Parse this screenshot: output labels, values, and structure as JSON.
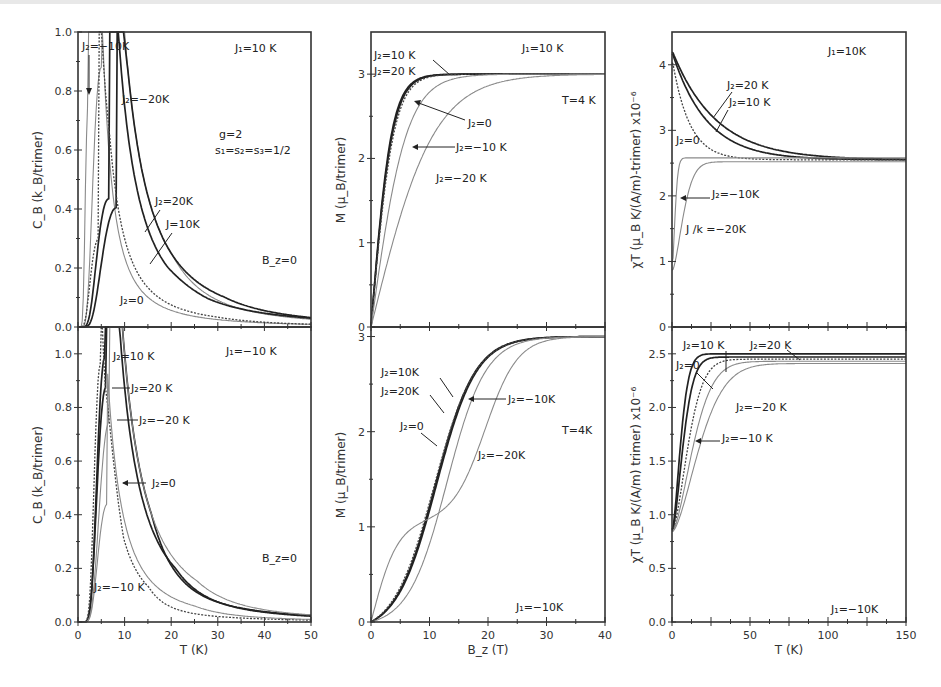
{
  "figure": {
    "params": {
      "g": "g=2",
      "spins": "s1=s2=s3=1/2"
    }
  },
  "chart_data": [
    {
      "id": "cb-top",
      "type": "line",
      "title": "",
      "xlabel": "T (K)",
      "ylabel": "C_B (k_B/trimer)",
      "xlim": [
        0,
        50
      ],
      "ylim": [
        0,
        1.0
      ],
      "xticks": [
        0,
        10,
        20,
        30,
        40,
        50
      ],
      "yticks": [
        0.0,
        0.2,
        0.4,
        0.6,
        0.8,
        1.0
      ],
      "ytick_labels": [
        "0.0",
        "0.2",
        "0.4",
        "0.6",
        "0.8",
        "1.0"
      ],
      "show_xtick_labels": false,
      "grid": false,
      "annotations": [
        "J1=10K",
        "g=2",
        "s1=s2=s3=1/2",
        "B_z=0"
      ],
      "series": [
        {
          "name": "J2=-10K",
          "style": "gray",
          "peak_T": 2.2,
          "peak_C": 0.76,
          "width": 0.55,
          "tail": 0.015
        },
        {
          "name": "J2=-20K",
          "style": "gray",
          "peak_T": 5.0,
          "peak_C": 0.88,
          "width": 0.7,
          "tail": 0.04
        },
        {
          "name": "J2=20K",
          "style": "black",
          "peak_T": 6.6,
          "peak_C": 0.435,
          "width": 0.75,
          "tail": 0.04
        },
        {
          "name": "J2=10K",
          "style": "black",
          "peak_T": 8.3,
          "peak_C": 0.405,
          "width": 0.75,
          "tail": 0.03
        },
        {
          "name": "J2=0",
          "style": "dotted",
          "peak_T": 4.5,
          "peak_C": 0.3,
          "width": 0.8,
          "tail": 0.012
        }
      ]
    },
    {
      "id": "cb-bottom",
      "type": "line",
      "xlabel": "T (K)",
      "ylabel": "C_B (k_B/trimer)",
      "xlim": [
        0,
        50
      ],
      "ylim": [
        0,
        1.1
      ],
      "xticks": [
        0,
        10,
        20,
        30,
        40,
        50
      ],
      "yticks": [
        0.0,
        0.2,
        0.4,
        0.6,
        0.8,
        1.0
      ],
      "ytick_labels": [
        "0.0",
        "0.2",
        "0.4",
        "0.6",
        "0.8",
        "1.0"
      ],
      "show_xtick_labels": true,
      "annotations": [
        "J1=-10K",
        "B_z=0"
      ],
      "series": [
        {
          "name": "J2=10K",
          "style": "black",
          "peak_T": 5.8,
          "peak_C": 0.99,
          "width": 0.55,
          "tail": 0.04
        },
        {
          "name": "J2=20K",
          "style": "black",
          "peak_T": 6.0,
          "peak_C": 0.875,
          "width": 0.6,
          "tail": 0.035
        },
        {
          "name": "J2=-20K",
          "style": "gray",
          "peak_T": 6.8,
          "peak_C": 0.75,
          "width": 0.62,
          "tail": 0.04
        },
        {
          "name": "J2=0",
          "style": "dotted",
          "peak_T": 4.8,
          "peak_C": 0.96,
          "width": 0.5,
          "tail": 0.012
        },
        {
          "name": "J2=-10K",
          "style": "gray",
          "peak_T": 6.3,
          "peak_C": 0.44,
          "width": 0.6,
          "tail": 0.015
        }
      ]
    },
    {
      "id": "m-top",
      "type": "line",
      "xlabel": "B_z (T)",
      "ylabel": "M (μ_B/trimer)",
      "xlim": [
        0,
        40
      ],
      "ylim": [
        0,
        3.5
      ],
      "xticks": [
        0,
        10,
        20,
        30,
        40
      ],
      "yticks": [
        0,
        1,
        2,
        3
      ],
      "ytick_labels": [
        "0",
        "1",
        "2",
        "3"
      ],
      "show_xtick_labels": false,
      "annotations": [
        "J1=10K",
        "T=4K"
      ],
      "series": [
        {
          "name": "J2=10K",
          "style": "black",
          "sat": 3.0,
          "k": 0.52,
          "plateau": 0
        },
        {
          "name": "J2=20K",
          "style": "black",
          "sat": 3.0,
          "k": 0.5,
          "plateau": 0
        },
        {
          "name": "J2=0",
          "style": "dotted",
          "sat": 3.0,
          "k": 0.47,
          "plateau": 0
        },
        {
          "name": "J2=-10K",
          "style": "gray",
          "sat": 3.0,
          "k": 0.3,
          "plateau": 0
        },
        {
          "name": "J2=-20K",
          "style": "gray",
          "sat": 3.0,
          "k": 0.17,
          "plateau": 0
        }
      ]
    },
    {
      "id": "m-bottom",
      "type": "line",
      "xlabel": "B_z (T)",
      "ylabel": "M (μ_B/trimer)",
      "xlim": [
        0,
        40
      ],
      "ylim": [
        0,
        3.1
      ],
      "xticks": [
        0,
        10,
        20,
        30,
        40
      ],
      "xtick_labels": [
        "0",
        "10",
        "20",
        "30",
        "40"
      ],
      "yticks": [
        0,
        1,
        2,
        3
      ],
      "ytick_labels": [
        "0",
        "1",
        "2",
        "3"
      ],
      "show_xtick_labels": true,
      "annotations": [
        "J1=-10K",
        "T=4K"
      ],
      "series": [
        {
          "name": "J2=10K",
          "style": "black",
          "Bc": 11.0,
          "w": 3.4
        },
        {
          "name": "J2=20K",
          "style": "black",
          "Bc": 11.2,
          "w": 3.4
        },
        {
          "name": "J2=0",
          "style": "dotted",
          "Bc": 10.8,
          "w": 3.5
        },
        {
          "name": "J2=-10K",
          "style": "gray",
          "Bc": 13.0,
          "w": 3.3
        },
        {
          "name": "J2=-20K",
          "style": "gray",
          "Bc": 19.5,
          "w": 2.8,
          "plateau": 1.0
        }
      ]
    },
    {
      "id": "chit-top",
      "type": "line",
      "xlabel": "T (K)",
      "ylabel": "χT (μ_B K/(A/m)-trimer) x10^-6",
      "xlim": [
        0,
        150
      ],
      "ylim": [
        0,
        4.5
      ],
      "xticks": [
        0,
        25,
        50,
        75,
        100,
        125,
        150
      ],
      "yticks": [
        0,
        1,
        2,
        3,
        4
      ],
      "ytick_labels": [
        "0",
        "1",
        "2",
        "3",
        "4"
      ],
      "show_xtick_labels": false,
      "annotations": [
        "J1=10K"
      ],
      "series": [
        {
          "name": "J2=20K",
          "style": "black",
          "low": 4.22,
          "high": 2.55,
          "tau": 28,
          "rise": 0
        },
        {
          "name": "J2=10K",
          "style": "black",
          "low": 4.2,
          "high": 2.55,
          "tau": 22,
          "rise": 0
        },
        {
          "name": "J2=0",
          "style": "dotted",
          "low": 4.1,
          "high": 2.55,
          "tau": 11,
          "rise": 0
        },
        {
          "name": "J2=-10K",
          "style": "gray",
          "low": 0.85,
          "high": 2.58,
          "tau": 2.5,
          "rise": 1
        },
        {
          "name": "J/k=-20K",
          "style": "gray",
          "low": 0.85,
          "high": 2.52,
          "tau": 9,
          "rise": 1
        }
      ]
    },
    {
      "id": "chit-bottom",
      "type": "line",
      "xlabel": "T (K)",
      "ylabel": "χT (μ_B K/(A/m) trimer) x10^-6",
      "xlim": [
        0,
        150
      ],
      "ylim": [
        0,
        2.75
      ],
      "xticks": [
        0,
        25,
        50,
        75,
        100,
        125,
        150
      ],
      "xtick_labels": [
        "0",
        "",
        "50",
        "",
        "100",
        "",
        "150"
      ],
      "yticks": [
        0.0,
        0.5,
        1.0,
        1.5,
        2.0,
        2.5
      ],
      "ytick_labels": [
        "0.0",
        "0.5",
        "1.0",
        "1.5",
        "2.0",
        "2.5"
      ],
      "show_xtick_labels": true,
      "annotations": [
        "J1=-10K"
      ],
      "series": [
        {
          "name": "J2=20K",
          "style": "black",
          "low": 0.84,
          "high": 2.5,
          "tau": 7,
          "rise": 1
        },
        {
          "name": "J2=10K",
          "style": "black",
          "low": 0.84,
          "high": 2.47,
          "tau": 9,
          "rise": 1
        },
        {
          "name": "J2=0",
          "style": "dotted",
          "low": 0.84,
          "high": 2.45,
          "tau": 13,
          "rise": 1
        },
        {
          "name": "J2=-20K",
          "style": "gray",
          "low": 0.84,
          "high": 2.43,
          "tau": 17,
          "rise": 1
        },
        {
          "name": "J2=-10K",
          "style": "gray",
          "low": 0.84,
          "high": 2.41,
          "tau": 22,
          "rise": 1
        }
      ]
    }
  ],
  "labels": {
    "cb_top": {
      "j1": "J₁=10 K",
      "j2_m10": "J₂=−10K",
      "j2_m20": "J₂=−20K",
      "g": "g=2",
      "spins": "s₁=s₂=s₃=1/2",
      "j2_20": "J₂=20K",
      "j2_10": "J=10K",
      "bz": "B_z=0",
      "j2_0": "J₂=0"
    },
    "cb_bottom": {
      "j1": "J₁=−10 K",
      "j2_10": "J₂=10 K",
      "j2_20": "J₂=20 K",
      "j2_m20": "J₂=−20 K",
      "j2_0": "J₂=0",
      "bz": "B_z=0",
      "j2_m10": "J₂=−10 K"
    },
    "m_top": {
      "j1": "J₁=10 K",
      "j2_10": "J₂=10 K",
      "j2_20": "J₂=20 K",
      "t": "T=4 K",
      "j2_0": "J₂=0",
      "j2_m10": "J₂=−10 K",
      "j2_m20": "J₂=−20 K"
    },
    "m_bottom": {
      "j2_10": "J₂=10K",
      "j2_20": "J₂=20K",
      "j2_m10": "J₂=−10K",
      "j2_0": "J₂=0",
      "t": "T=4K",
      "j2_m20": "J₂=−20K",
      "j1": "J₁=−10K"
    },
    "chit_top": {
      "j1": "J₁=10K",
      "j2_20": "J₂=20 K",
      "j2_10": "J₂=10 K",
      "j2_0": "J₂=0",
      "j2_m10": "J₂=−10K",
      "j2_m20": "J /k =−20K"
    },
    "chit_bottom": {
      "j2_10": "J₂=10 K",
      "j2_20": "J₂=20 K",
      "j2_0": "J₂=0",
      "j2_m20": "J₂=−20 K",
      "j2_m10": "J₂=−10 K",
      "j1": "J₁=−10K"
    },
    "axes": {
      "cb_ylabel": "C_B (k_B/trimer)",
      "m_ylabel": "M (μ_B/trimer)",
      "chit_top_ylabel": "χT (μ_B K/(A/m)-trimer) x10⁻⁶",
      "chit_bottom_ylabel": "χT (μ_B K/(A/m) trimer) x10⁻⁶",
      "t_xlabel": "T (K)",
      "b_xlabel": "B_z (T)"
    }
  },
  "styles": {
    "black": "#222222",
    "gray": "#8a8a8a",
    "dotted": "#444444"
  }
}
